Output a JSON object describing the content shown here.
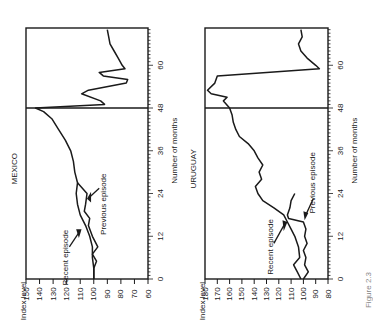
{
  "figure": {
    "caption": "Figure 2.3",
    "orientation": "rotated-90-ccw",
    "ink_color": "#1a1a1a",
    "background": "#ffffff"
  },
  "chart_data": [
    {
      "type": "line",
      "title": "MEXICO",
      "xlabel": "Number of months",
      "ylabel": "Index level",
      "xlim": [
        0,
        70
      ],
      "ylim": [
        60,
        150
      ],
      "x_ticks": [
        0,
        12,
        24,
        36,
        48,
        60
      ],
      "y_ticks": [
        150,
        140,
        130,
        120,
        110,
        100,
        90,
        80,
        70,
        60
      ],
      "vertical_divider_at_month": 48,
      "grid": false,
      "annotations": [
        {
          "text": "Recent episode",
          "points_to_series": "Recent episode"
        },
        {
          "text": "Previous episode",
          "points_to_series": "Previous episode"
        }
      ],
      "series": [
        {
          "name": "Recent episode",
          "x": [
            0,
            3,
            6,
            9,
            12,
            15,
            18,
            21,
            24,
            27,
            30,
            33,
            36,
            39,
            42,
            45,
            47,
            48,
            49,
            50,
            52,
            53,
            55,
            56,
            57,
            58,
            59,
            60,
            62,
            64,
            66,
            68,
            70
          ],
          "values": [
            100,
            100,
            101,
            101,
            103,
            106,
            110,
            112,
            113,
            112,
            114,
            115,
            117,
            121,
            126,
            131,
            137,
            143,
            92,
            95,
            109,
            104,
            76,
            75,
            93,
            96,
            77,
            79,
            82,
            85,
            88,
            89,
            90
          ]
        },
        {
          "name": "Previous episode",
          "x": [
            0,
            3,
            5,
            7,
            9,
            12,
            15,
            17,
            19,
            21,
            24,
            27
          ],
          "values": [
            100,
            100,
            98,
            101,
            97,
            101,
            104,
            103,
            107,
            106,
            105,
            112
          ]
        }
      ]
    },
    {
      "type": "line",
      "title": "URUGUAY",
      "xlabel": "Number of months",
      "ylabel": "Index level",
      "xlim": [
        0,
        70
      ],
      "ylim": [
        80,
        180
      ],
      "x_ticks": [
        0,
        12,
        24,
        36,
        48,
        60
      ],
      "y_ticks": [
        180,
        170,
        160,
        150,
        140,
        130,
        120,
        110,
        100,
        90,
        80
      ],
      "vertical_divider_at_month": 48,
      "grid": false,
      "annotations": [
        {
          "text": "Recent episode",
          "points_to_series": "Recent episode"
        },
        {
          "text": "Previous episode",
          "points_to_series": "Previous episode"
        }
      ],
      "series": [
        {
          "name": "Recent episode",
          "x": [
            0,
            2,
            4,
            6,
            9,
            12,
            14,
            16,
            18,
            20,
            22,
            24,
            26,
            28,
            30,
            32,
            34,
            36,
            38,
            40,
            42,
            44,
            46,
            48,
            50,
            51,
            52,
            53,
            55,
            57,
            59,
            60,
            62,
            64,
            66,
            68,
            70
          ],
          "values": [
            102,
            105,
            108,
            103,
            104,
            107,
            110,
            113,
            116,
            124,
            133,
            137,
            139,
            134,
            136,
            133,
            137,
            140,
            145,
            152,
            155,
            157,
            158,
            160,
            165,
            162,
            175,
            178,
            172,
            170,
            87,
            90,
            97,
            102,
            104,
            101,
            102
          ]
        },
        {
          "name": "Previous episode",
          "x": [
            0,
            2,
            4,
            6,
            8,
            10,
            12,
            14,
            16,
            17,
            18,
            20,
            22,
            24
          ],
          "values": [
            100,
            96,
            99,
            98,
            100,
            97,
            99,
            98,
            100,
            112,
            113,
            111,
            110,
            107
          ]
        }
      ]
    }
  ]
}
